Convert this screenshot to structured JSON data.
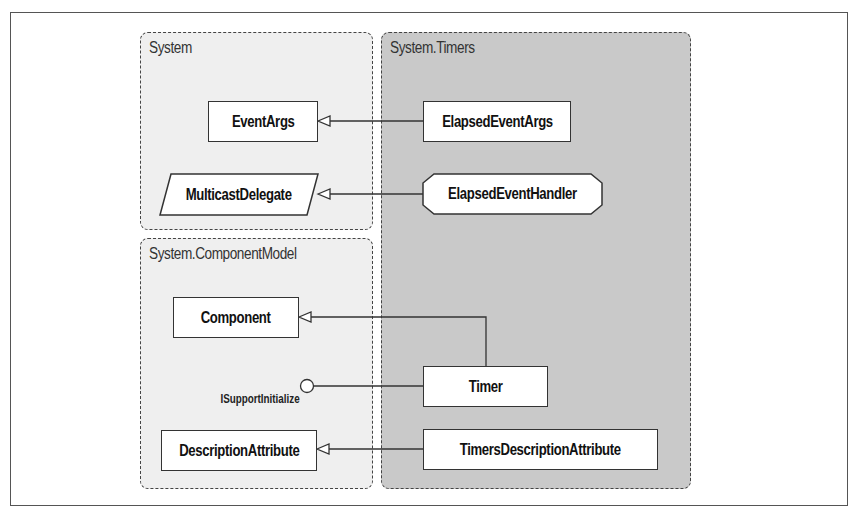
{
  "diagram": {
    "packages": [
      {
        "id": "system",
        "title": "System"
      },
      {
        "id": "system-componentmodel",
        "title": "System.ComponentModel"
      },
      {
        "id": "system-timers",
        "title": "System.Timers"
      }
    ],
    "classes": {
      "event_args": "EventArgs",
      "multicast_delegate": "MulticastDelegate",
      "elapsed_event_args": "ElapsedEventArgs",
      "elapsed_event_handler": "ElapsedEventHandler",
      "component": "Component",
      "timer": "Timer",
      "description_attribute": "DescriptionAttribute",
      "timers_description_attribute": "TimersDescriptionAttribute"
    },
    "interfaces": {
      "isupport_initialize": "ISupportInitialize"
    },
    "relationships": [
      {
        "from": "ElapsedEventArgs",
        "to": "EventArgs",
        "type": "inheritance"
      },
      {
        "from": "ElapsedEventHandler",
        "to": "MulticastDelegate",
        "type": "inheritance"
      },
      {
        "from": "Timer",
        "to": "Component",
        "type": "inheritance"
      },
      {
        "from": "Timer",
        "to": "ISupportInitialize",
        "type": "implements"
      },
      {
        "from": "TimersDescriptionAttribute",
        "to": "DescriptionAttribute",
        "type": "inheritance"
      }
    ]
  }
}
